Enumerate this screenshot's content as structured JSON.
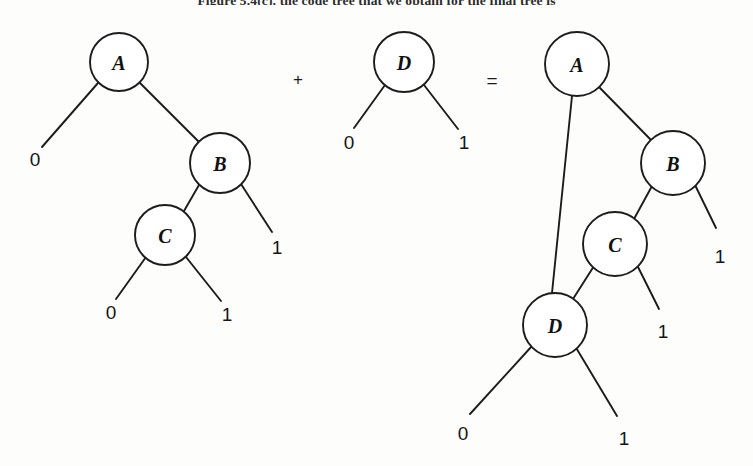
{
  "figure": {
    "caption_fragment": "Figure 5.4(c), the code tree that we obtain for the final tree is",
    "background_color": "#fdfdfc",
    "ink_color": "#1c1c1c",
    "operators": [
      {
        "name": "plus",
        "symbol": "+",
        "x": 298,
        "y": 79
      },
      {
        "name": "equals",
        "symbol": "=",
        "x": 492,
        "y": 80
      }
    ]
  },
  "trees": [
    {
      "id": "tree-left",
      "name": "left-operand-tree",
      "nodes": [
        {
          "id": "A",
          "label": "A",
          "cx": 119,
          "cy": 62,
          "r": 29
        },
        {
          "id": "B",
          "label": "B",
          "cx": 220,
          "cy": 163,
          "r": 30
        },
        {
          "id": "C",
          "label": "C",
          "cx": 165,
          "cy": 235,
          "r": 30
        }
      ],
      "edges": [
        {
          "from": "A",
          "to": "leaf-A-0",
          "x1": 98,
          "y1": 83,
          "x2": 42,
          "y2": 147
        },
        {
          "from": "A",
          "to": "B",
          "x1": 140,
          "y1": 83,
          "x2": 200,
          "y2": 143
        },
        {
          "from": "B",
          "to": "C",
          "x1": 199,
          "y1": 185,
          "x2": 184,
          "y2": 211
        },
        {
          "from": "B",
          "to": "leaf-B-1",
          "x1": 241,
          "y1": 184,
          "x2": 272,
          "y2": 232
        },
        {
          "from": "C",
          "to": "leaf-C-0",
          "x1": 146,
          "y1": 257,
          "x2": 116,
          "y2": 299
        },
        {
          "from": "C",
          "to": "leaf-C-1",
          "x1": 186,
          "y1": 257,
          "x2": 221,
          "y2": 301
        }
      ],
      "leaves": [
        {
          "id": "leaf-A-0",
          "label": "0",
          "x": 35,
          "y": 159
        },
        {
          "id": "leaf-B-1",
          "label": "1",
          "x": 277,
          "y": 247
        },
        {
          "id": "leaf-C-0",
          "label": "0",
          "x": 111,
          "y": 312
        },
        {
          "id": "leaf-C-1",
          "label": "1",
          "x": 227,
          "y": 314
        }
      ]
    },
    {
      "id": "tree-middle",
      "name": "right-operand-tree",
      "nodes": [
        {
          "id": "D",
          "label": "D",
          "cx": 404,
          "cy": 62,
          "r": 30
        }
      ],
      "edges": [
        {
          "from": "D",
          "to": "leaf-D-0",
          "x1": 385,
          "y1": 85,
          "x2": 354,
          "y2": 128
        },
        {
          "from": "D",
          "to": "leaf-D-1",
          "x1": 424,
          "y1": 85,
          "x2": 458,
          "y2": 129
        }
      ],
      "leaves": [
        {
          "id": "leaf-D-0",
          "label": "0",
          "x": 349,
          "y": 142
        },
        {
          "id": "leaf-D-1",
          "label": "1",
          "x": 464,
          "y": 142
        }
      ]
    },
    {
      "id": "tree-result",
      "name": "result-tree",
      "nodes": [
        {
          "id": "A",
          "label": "A",
          "cx": 577,
          "cy": 64,
          "r": 32
        },
        {
          "id": "B",
          "label": "B",
          "cx": 673,
          "cy": 163,
          "r": 32
        },
        {
          "id": "C",
          "label": "C",
          "cx": 615,
          "cy": 244,
          "r": 32
        },
        {
          "id": "D",
          "label": "D",
          "cx": 555,
          "cy": 325,
          "r": 32
        }
      ],
      "edges": [
        {
          "from": "A",
          "to": "D",
          "x1": 572,
          "y1": 96,
          "x2": 552,
          "y2": 293
        },
        {
          "from": "A",
          "to": "B",
          "x1": 599,
          "y1": 87,
          "x2": 651,
          "y2": 140
        },
        {
          "from": "B",
          "to": "C",
          "x1": 652,
          "y1": 186,
          "x2": 634,
          "y2": 219
        },
        {
          "from": "B",
          "to": "leaf-B-1",
          "x1": 695,
          "y1": 185,
          "x2": 716,
          "y2": 228
        },
        {
          "from": "C",
          "to": "D",
          "x1": 594,
          "y1": 266,
          "x2": 573,
          "y2": 299
        },
        {
          "from": "C",
          "to": "leaf-C-1",
          "x1": 637,
          "y1": 265,
          "x2": 659,
          "y2": 309
        },
        {
          "from": "D",
          "to": "leaf-D-0",
          "x1": 532,
          "y1": 346,
          "x2": 470,
          "y2": 414
        },
        {
          "from": "D",
          "to": "leaf-D-1",
          "x1": 575,
          "y1": 346,
          "x2": 617,
          "y2": 416
        }
      ],
      "leaves": [
        {
          "id": "leaf-B-1",
          "label": "1",
          "x": 720,
          "y": 256
        },
        {
          "id": "leaf-C-1",
          "label": "1",
          "x": 663,
          "y": 331
        },
        {
          "id": "leaf-D-0",
          "label": "0",
          "x": 463,
          "y": 433
        },
        {
          "id": "leaf-D-1",
          "label": "1",
          "x": 624,
          "y": 438
        }
      ]
    }
  ]
}
